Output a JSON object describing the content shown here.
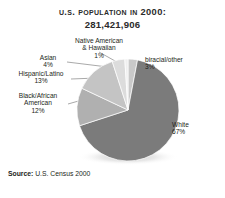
{
  "header": {
    "title": "U.S. Population in 2000:",
    "subtitle": "281,421,906"
  },
  "footer": {
    "source_label": "Source:",
    "source_text": " U.S. Census 2000"
  },
  "labels": {
    "native": {
      "line1": "Native American",
      "line2": "& Hawaiian",
      "pct": "1%"
    },
    "asian": {
      "name": "Asian",
      "pct": "4%"
    },
    "hispanic": {
      "name": "Hispanic/Latino",
      "pct": "13%"
    },
    "black": {
      "line1": "Black/African",
      "line2": "American",
      "pct": "12%"
    },
    "biracial": {
      "name": "biracial/other",
      "pct": "3%"
    },
    "white": {
      "name": "White",
      "pct": "67%"
    }
  },
  "chart_data": {
    "type": "pie",
    "title": "U.S. Population in 2000: 281,421,906",
    "total": 281421906,
    "units": "percent",
    "start_angle_deg": 0,
    "direction": "clockwise",
    "legend": "none",
    "labels_position": "outside-with-leader-lines",
    "categories": [
      "biracial/other",
      "White",
      "Black/African American",
      "Hispanic/Latino",
      "Asian",
      "Native American & Hawaiian"
    ],
    "values": [
      3,
      67,
      12,
      13,
      4,
      1
    ],
    "colors": [
      "#c9c9c9",
      "#7b7b7b",
      "#b0b0b0",
      "#c4c4c4",
      "#dcdcdc",
      "#efefef"
    ],
    "slices": [
      {
        "label": "biracial/other",
        "value": 3,
        "color": "#c9c9c9"
      },
      {
        "label": "White",
        "value": 67,
        "color": "#7b7b7b"
      },
      {
        "label": "Black/African American",
        "value": 12,
        "color": "#b0b0b0"
      },
      {
        "label": "Hispanic/Latino",
        "value": 13,
        "color": "#c4c4c4"
      },
      {
        "label": "Asian",
        "value": 4,
        "color": "#dcdcdc"
      },
      {
        "label": "Native American & Hawaiian",
        "value": 1,
        "color": "#efefef"
      }
    ],
    "source": "U.S. Census 2000"
  }
}
